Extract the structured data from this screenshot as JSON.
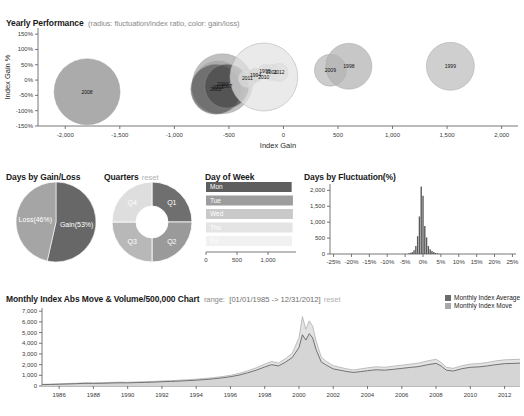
{
  "yearly": {
    "title": "Yearly Performance",
    "subtitle": "(radius: fluctuation/index ratio, color: gain/loss)",
    "xlabel": "Index Gain",
    "ylabel": "Index Gain %"
  },
  "gainloss": {
    "title": "Days by Gain/Loss"
  },
  "quarters": {
    "title": "Quarters",
    "reset": "reset"
  },
  "dayofweek": {
    "title": "Day of Week"
  },
  "fluctuation": {
    "title": "Days by Fluctuation(%)"
  },
  "monthly": {
    "title": "Monthly Index Abs Move & Volume/500,000 Chart",
    "range_label": "range:",
    "range_value": "[01/01/1985 -> 12/31/2012]",
    "reset": "reset",
    "legend": [
      {
        "name": "Monthly Index Average",
        "color": "#6b6b6b"
      },
      {
        "name": "Monthly Index Move",
        "color": "#a8a8a8"
      }
    ]
  },
  "chart_data": [
    {
      "type": "scatter",
      "name": "yearly-performance-bubble",
      "title": "Yearly Performance",
      "subtitle": "radius: fluctuation/index ratio, color: gain/loss",
      "xlabel": "Index Gain",
      "ylabel": "Index Gain %",
      "xlim": [
        -2250,
        2150
      ],
      "ylim": [
        -150,
        170
      ],
      "xticks": [
        -2000,
        -1500,
        -1000,
        -500,
        0,
        500,
        1000,
        1500,
        2000
      ],
      "xticklabels": [
        "-2,000",
        "-1,500",
        "-1,000",
        "-500",
        "0",
        "500",
        "1,000",
        "1,500",
        "2,000"
      ],
      "yticks": [
        150,
        100,
        50,
        0,
        -50,
        -100,
        -150
      ],
      "yticklabels": [
        "150%",
        "100%",
        "50%",
        "0%",
        "-50%",
        "-100%",
        "-150%"
      ],
      "grid": false,
      "points": [
        {
          "label": "2008",
          "x": -1800,
          "y": -38,
          "r": 33,
          "color": "#8a8a8a"
        },
        {
          "label": "2002",
          "x": -600,
          "y": -23,
          "r": 26,
          "color": "#9b9b9b"
        },
        {
          "label": "2000",
          "x": -560,
          "y": -12,
          "r": 30,
          "color": "#a8a8a8"
        },
        {
          "label": "2001",
          "x": -620,
          "y": -30,
          "r": 25,
          "color": "#5a5a5a"
        },
        {
          "label": "2007",
          "x": -520,
          "y": -20,
          "r": 22,
          "color": "#4a4a4a"
        },
        {
          "label": "2011",
          "x": -330,
          "y": 5,
          "r": 9,
          "color": "#c8c8c8"
        },
        {
          "label": "1994",
          "x": -255,
          "y": 16,
          "r": 7,
          "color": "#b5b5b5"
        },
        {
          "label": "1995",
          "x": -170,
          "y": 28,
          "r": 7,
          "color": "#cfcfcf"
        },
        {
          "label": "2001",
          "x": -110,
          "y": 25,
          "r": 8,
          "color": "#d8d8d8"
        },
        {
          "label": "2012",
          "x": -40,
          "y": 25,
          "r": 9,
          "color": "#d4d4d4"
        },
        {
          "label": "2010",
          "x": -180,
          "y": 10,
          "r": 34,
          "color": "#e2e2e2"
        },
        {
          "label": "2009",
          "x": 430,
          "y": 32,
          "r": 16,
          "color": "#b9b9b9"
        },
        {
          "label": "1998",
          "x": 600,
          "y": 45,
          "r": 23,
          "color": "#b2b2b2"
        },
        {
          "label": "1999",
          "x": 1530,
          "y": 45,
          "r": 24,
          "color": "#bdbdbd"
        }
      ]
    },
    {
      "type": "pie",
      "name": "days-by-gain-loss",
      "title": "Days by Gain/Loss",
      "slices": [
        {
          "label": "Gain(53%)",
          "value": 53,
          "color": "#676767"
        },
        {
          "label": "Loss(46%)",
          "value": 46,
          "color": "#a5a5a5"
        }
      ]
    },
    {
      "type": "pie",
      "name": "quarters-donut",
      "title": "Quarters",
      "donut": true,
      "slices": [
        {
          "label": "Q1",
          "value": 25,
          "color": "#6f6f6f"
        },
        {
          "label": "Q2",
          "value": 25,
          "color": "#9a9a9a"
        },
        {
          "label": "Q3",
          "value": 25,
          "color": "#b8b8b8"
        },
        {
          "label": "Q4",
          "value": 25,
          "color": "#dedede"
        }
      ]
    },
    {
      "type": "bar",
      "name": "day-of-week",
      "title": "Day of Week",
      "orientation": "horizontal",
      "categories": [
        "Mon",
        "Tue",
        "Wed",
        "Thu",
        "Fri"
      ],
      "values": [
        1380,
        1400,
        1400,
        1395,
        1385
      ],
      "colors": [
        "#5e5e5e",
        "#9d9d9d",
        "#c9c9c9",
        "#e4e4e4",
        "#f1f1f1"
      ],
      "xticks": [
        0,
        500,
        1000
      ],
      "xticklabels": [
        "0",
        "500",
        "1,000"
      ],
      "xlim": [
        0,
        1450
      ]
    },
    {
      "type": "bar",
      "name": "days-by-fluctuation",
      "title": "Days by Fluctuation(%)",
      "xlabel": "",
      "ylabel": "",
      "xticks": [
        -25,
        -20,
        -15,
        -10,
        -5,
        0,
        5,
        10,
        15,
        20,
        25
      ],
      "xticklabels": [
        "-25%",
        "-20%",
        "-15%",
        "-10%",
        "-5%",
        "0%",
        "5%",
        "10%",
        "15%",
        "20%",
        "25%"
      ],
      "yticks": [
        0,
        500,
        1000,
        1500,
        2000
      ],
      "yticklabels": [
        "0",
        "500",
        "1,000",
        "1,500",
        "2,000"
      ],
      "ylim": [
        0,
        2200
      ],
      "xlim": [
        -26,
        26
      ],
      "bin_centers": [
        -4.0,
        -3.5,
        -3.0,
        -2.5,
        -2.0,
        -1.5,
        -1.0,
        -0.5,
        0.0,
        0.5,
        1.0,
        1.5,
        2.0,
        2.5,
        3.0,
        3.5,
        4.0,
        4.5
      ],
      "values": [
        20,
        35,
        60,
        120,
        250,
        560,
        1180,
        2120,
        1830,
        880,
        520,
        250,
        150,
        95,
        60,
        35,
        20,
        10
      ],
      "color": "#5a5a5a"
    },
    {
      "type": "area",
      "name": "monthly-index-move-volume",
      "title": "Monthly Index Abs Move & Volume/500,000 Chart",
      "range": "[01/01/1985 -> 12/31/2012]",
      "xticks": [
        1986,
        1988,
        1990,
        1992,
        1994,
        1996,
        1998,
        2000,
        2002,
        2004,
        2006,
        2008,
        2010,
        2012
      ],
      "xticklabels": [
        "1986",
        "1988",
        "1990",
        "1992",
        "1994",
        "1996",
        "1998",
        "2000",
        "2002",
        "2004",
        "2006",
        "2008",
        "2010",
        "2012"
      ],
      "yticks": [
        0,
        1000,
        2000,
        3000,
        4000,
        5000,
        6000,
        7000
      ],
      "yticklabels": [
        "0",
        "1,000",
        "2,000",
        "3,000",
        "4,000",
        "5,000",
        "6,000",
        "7,000"
      ],
      "xlim": [
        1985,
        2012.9
      ],
      "ylim": [
        0,
        7300
      ],
      "series": [
        {
          "name": "Monthly Index Move",
          "color": "#cfcfcf",
          "x": [
            1985,
            1985.5,
            1986,
            1986.5,
            1987,
            1987.5,
            1988,
            1988.5,
            1989,
            1989.5,
            1990,
            1990.5,
            1991,
            1991.5,
            1992,
            1992.5,
            1993,
            1993.5,
            1994,
            1994.5,
            1995,
            1995.5,
            1996,
            1996.5,
            1997,
            1997.5,
            1998,
            1998.4,
            1998.8,
            1999.2,
            1999.6,
            2000,
            2000.2,
            2000.4,
            2000.6,
            2000.8,
            2001,
            2001.3,
            2001.6,
            2002,
            2002.4,
            2002.8,
            2003.2,
            2003.6,
            2004,
            2004.5,
            2005,
            2005.5,
            2006,
            2006.5,
            2007,
            2007.5,
            2008,
            2008.3,
            2008.6,
            2009,
            2009.5,
            2010,
            2010.5,
            2011,
            2011.5,
            2012,
            2012.9
          ],
          "y": [
            160,
            175,
            200,
            230,
            260,
            300,
            290,
            300,
            330,
            360,
            350,
            380,
            400,
            430,
            470,
            500,
            540,
            590,
            640,
            700,
            780,
            880,
            1000,
            1180,
            1420,
            1700,
            2050,
            2300,
            2150,
            2550,
            3050,
            4500,
            6500,
            5300,
            6100,
            5600,
            4200,
            2700,
            2300,
            1900,
            1750,
            1600,
            1500,
            1600,
            1700,
            1800,
            1750,
            1850,
            1950,
            2050,
            2150,
            2350,
            2500,
            2200,
            1750,
            1650,
            1900,
            2050,
            2100,
            2200,
            2350,
            2450,
            2500
          ]
        },
        {
          "name": "Monthly Index Average",
          "color": "#6b6b6b",
          "x": [
            1985,
            1985.5,
            1986,
            1986.5,
            1987,
            1987.5,
            1988,
            1988.5,
            1989,
            1989.5,
            1990,
            1990.5,
            1991,
            1991.5,
            1992,
            1992.5,
            1993,
            1993.5,
            1994,
            1994.5,
            1995,
            1995.5,
            1996,
            1996.5,
            1997,
            1997.5,
            1998,
            1998.4,
            1998.8,
            1999.2,
            1999.6,
            2000,
            2000.2,
            2000.4,
            2000.6,
            2000.8,
            2001,
            2001.3,
            2001.6,
            2002,
            2002.4,
            2002.8,
            2003.2,
            2003.6,
            2004,
            2004.5,
            2005,
            2005.5,
            2006,
            2006.5,
            2007,
            2007.5,
            2008,
            2008.3,
            2008.6,
            2009,
            2009.5,
            2010,
            2010.5,
            2011,
            2011.5,
            2012,
            2012.9
          ],
          "y": [
            130,
            145,
            165,
            190,
            215,
            250,
            245,
            255,
            280,
            300,
            295,
            320,
            340,
            365,
            400,
            425,
            460,
            500,
            545,
            600,
            670,
            760,
            870,
            1020,
            1230,
            1480,
            1780,
            2000,
            1880,
            2220,
            2650,
            3600,
            4800,
            4300,
            4900,
            4500,
            3400,
            2250,
            1950,
            1600,
            1480,
            1350,
            1270,
            1350,
            1430,
            1520,
            1480,
            1560,
            1650,
            1740,
            1820,
            1990,
            2120,
            1870,
            1480,
            1400,
            1620,
            1750,
            1790,
            1880,
            2000,
            2090,
            2140
          ]
        }
      ]
    }
  ]
}
